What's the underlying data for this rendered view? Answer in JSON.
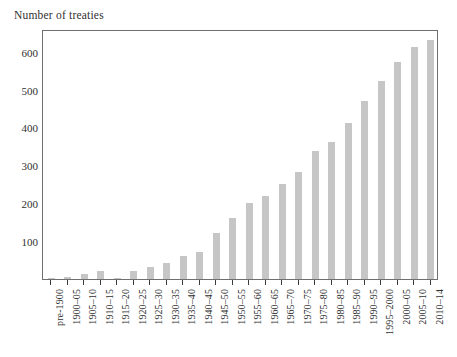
{
  "chart_data": {
    "type": "bar",
    "title": "",
    "subtitle": "",
    "ylabel": "Number of treaties",
    "xlabel": "",
    "ylim": [
      0,
      660
    ],
    "yticks": [
      100,
      200,
      300,
      400,
      500,
      600
    ],
    "grid": false,
    "legend": null,
    "bar_color": "#c6c6c6",
    "axis_color": "#6f6f6f",
    "text_color": "#30302f",
    "categories": [
      "pre-1900",
      "1900–05",
      "1905–10",
      "1910–15",
      "1915–20",
      "1920–25",
      "1925–30",
      "1930–35",
      "1935–40",
      "1940–45",
      "1945–50",
      "1950–55",
      "1955–60",
      "1960–65",
      "1965–70",
      "1970–75",
      "1975–80",
      "1980–85",
      "1985–90",
      "1990–95",
      "1995–2000",
      "2000–05",
      "2005–10",
      "2010–14"
    ],
    "values": [
      2,
      5,
      12,
      20,
      4,
      22,
      32,
      42,
      60,
      72,
      122,
      160,
      200,
      218,
      252,
      282,
      338,
      362,
      412,
      470,
      522,
      572,
      612,
      632
    ]
  },
  "axis": {
    "y_title": "Number of treaties"
  }
}
